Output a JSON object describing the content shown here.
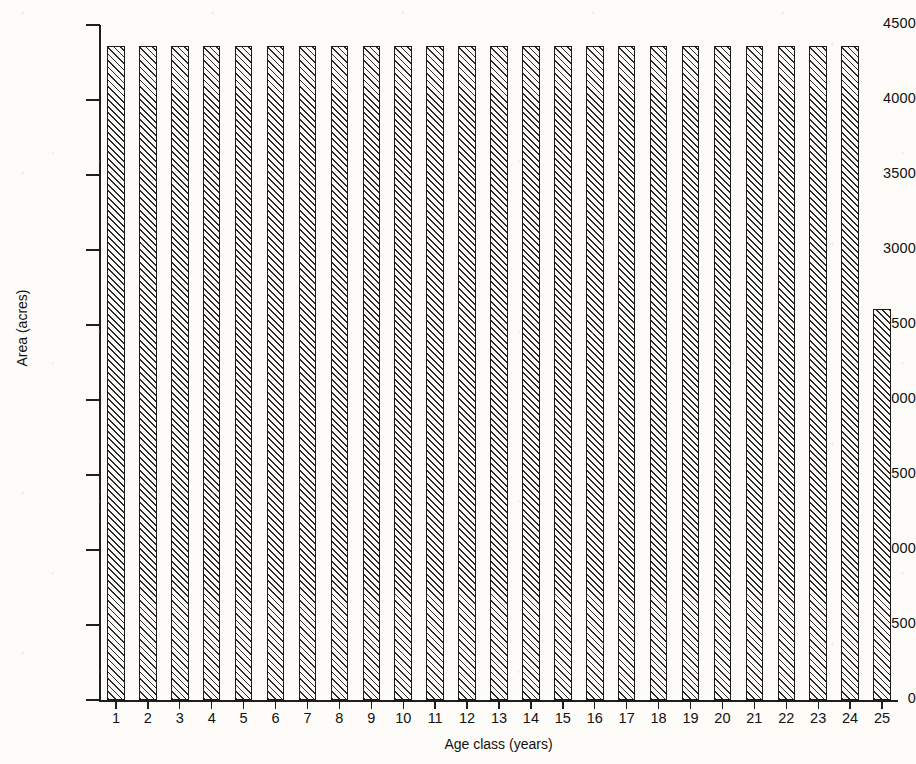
{
  "chart_data": {
    "type": "bar",
    "title": "",
    "xlabel": "Age class (years)",
    "ylabel": "Area (acres)",
    "categories": [
      "1",
      "2",
      "3",
      "4",
      "5",
      "6",
      "7",
      "8",
      "9",
      "10",
      "11",
      "12",
      "13",
      "14",
      "15",
      "16",
      "17",
      "18",
      "19",
      "20",
      "21",
      "22",
      "23",
      "24",
      "25"
    ],
    "values": [
      4360,
      4360,
      4360,
      4360,
      4360,
      4360,
      4360,
      4360,
      4360,
      4360,
      4360,
      4360,
      4360,
      4360,
      4360,
      4360,
      4360,
      4360,
      4360,
      4360,
      4360,
      4360,
      4360,
      4360,
      2610
    ],
    "ylim": [
      0,
      4500
    ],
    "ytick_labels": [
      "0",
      "500",
      "1000",
      "1500",
      "2000",
      "2500",
      "3000",
      "3500",
      "4000",
      "4500"
    ],
    "ytick_values": [
      0,
      500,
      1000,
      1500,
      2000,
      2500,
      3000,
      3500,
      4000,
      4500
    ],
    "grid": false,
    "legend": null,
    "bar_style": "diagonal-hatch-45deg-black-outline"
  }
}
